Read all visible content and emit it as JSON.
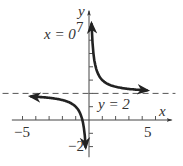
{
  "chart_data": {
    "type": "line",
    "title": "",
    "function": "y = 1/x + 2",
    "xlabel": "x",
    "ylabel": "y",
    "xlim": [
      -5.5,
      6
    ],
    "ylim": [
      -2.5,
      7.5
    ],
    "x_tick_labels": [
      "-5",
      "5"
    ],
    "y_tick_labels": [
      "7",
      "-2"
    ],
    "x_ticks": [
      -5,
      -4,
      -3,
      -2,
      -1,
      1,
      2,
      3,
      4,
      5
    ],
    "y_ticks": [
      -2,
      -1,
      1,
      2,
      3,
      4,
      5,
      6,
      7
    ],
    "asymptotes": [
      {
        "type": "vertical",
        "label": "x = 0",
        "value": 0
      },
      {
        "type": "horizontal",
        "label": "y = 2",
        "value": 2
      }
    ],
    "series": [
      {
        "name": "right branch",
        "x": [
          0.2,
          0.3,
          0.5,
          1,
          2,
          3,
          4.5
        ],
        "y": [
          7,
          5.33,
          4,
          3,
          2.5,
          2.33,
          2.22
        ]
      },
      {
        "name": "left branch",
        "x": [
          -4.5,
          -3,
          -2,
          -1,
          -0.5,
          -0.33,
          -0.25
        ],
        "y": [
          1.78,
          1.67,
          1.5,
          1,
          0,
          -1,
          -2
        ]
      }
    ],
    "grid": false
  },
  "labels": {
    "x_axis": "x",
    "y_axis": "y",
    "x_neg5": "−5",
    "x_pos5": "5",
    "y_top": "7",
    "y_bottom": "−2",
    "vert_asym": "x = 0",
    "horiz_asym": "y = 2"
  }
}
